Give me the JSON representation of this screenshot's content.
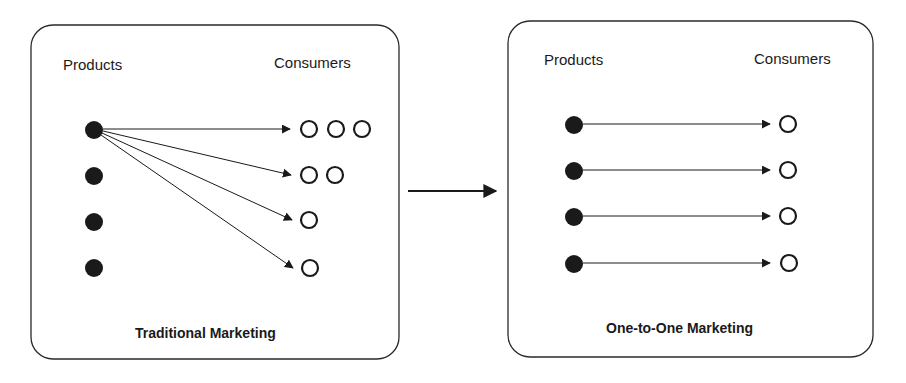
{
  "panels": [
    {
      "id": "traditional",
      "products_label": "Products",
      "consumers_label": "Consumers",
      "title": "Traditional Marketing",
      "products": 4,
      "consumer_rows": [
        3,
        2,
        1,
        1
      ],
      "mapping": "one product to all consumer groups"
    },
    {
      "id": "one-to-one",
      "products_label": "Products",
      "consumers_label": "Consumers",
      "title": "One-to-One Marketing",
      "products": 4,
      "consumer_rows": [
        1,
        1,
        1,
        1
      ],
      "mapping": "each product to one consumer"
    }
  ],
  "colors": {
    "ink": "#1a1a1a",
    "background": "#ffffff"
  }
}
